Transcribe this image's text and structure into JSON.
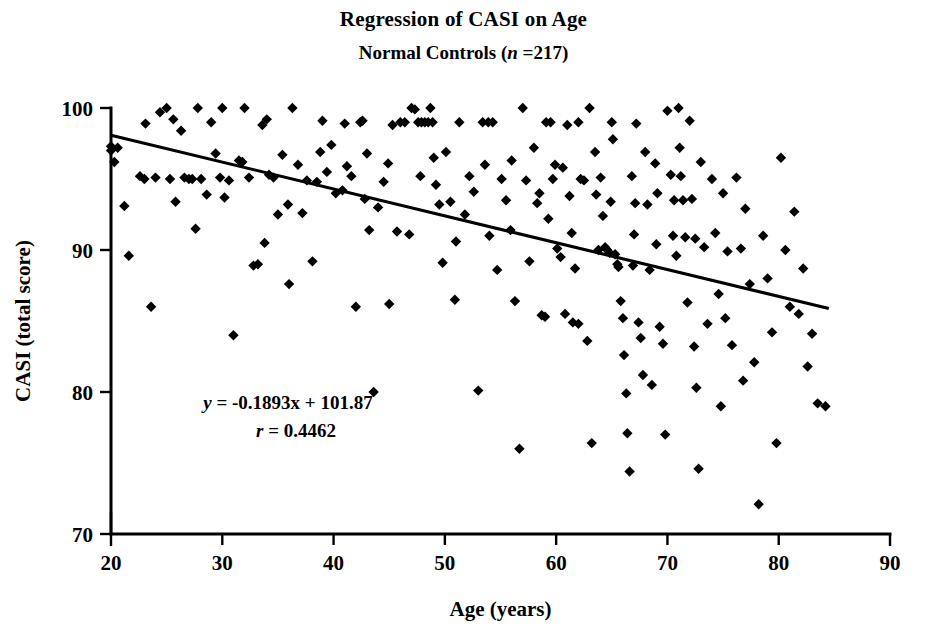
{
  "chart_data": {
    "type": "scatter",
    "title": "Regression of CASI on Age",
    "subtitle_prefix": "Normal Controls (",
    "subtitle_var": "n",
    "subtitle_suffix": " =217)",
    "subtitle_full": "Normal Controls (n =217)",
    "xlabel": "Age (years)",
    "ylabel": "CASI (total score)",
    "xlim": [
      20,
      90
    ],
    "ylim": [
      70,
      100
    ],
    "xticks": [
      20,
      30,
      40,
      50,
      60,
      70,
      80,
      90
    ],
    "yticks": [
      70,
      80,
      90,
      100
    ],
    "grid": false,
    "legend": "none",
    "n": 217,
    "marker": "diamond",
    "marker_color": "#000000",
    "annotations": {
      "equation_y": "y",
      "equation_body": " = -0.1893x  + 101.87",
      "equation_full": "y = -0.1893x  + 101.87",
      "correlation_r": "r",
      "correlation_body": " = 0.4462",
      "correlation_full": "r = 0.4462"
    },
    "fit": {
      "kind": "linear",
      "slope": -0.1893,
      "intercept": 101.87,
      "r": 0.4462,
      "x_start": 20,
      "x_end": 84.5,
      "y_start": 98.08,
      "y_end": 85.88
    },
    "points": [
      [
        20.0,
        97.3
      ],
      [
        20.0,
        97.0
      ],
      [
        20.3,
        96.2
      ],
      [
        20.6,
        97.2
      ],
      [
        21.2,
        93.1
      ],
      [
        21.6,
        89.6
      ],
      [
        22.6,
        95.2
      ],
      [
        23.0,
        95.0
      ],
      [
        23.1,
        98.9
      ],
      [
        23.6,
        86.0
      ],
      [
        24.0,
        95.1
      ],
      [
        24.4,
        99.7
      ],
      [
        25.0,
        100.0
      ],
      [
        25.3,
        95.0
      ],
      [
        25.8,
        93.4
      ],
      [
        26.3,
        98.4
      ],
      [
        26.6,
        95.1
      ],
      [
        27.0,
        95.0
      ],
      [
        27.3,
        95.0
      ],
      [
        27.6,
        91.5
      ],
      [
        28.1,
        95.0
      ],
      [
        28.6,
        93.9
      ],
      [
        29.0,
        99.0
      ],
      [
        29.4,
        96.8
      ],
      [
        29.8,
        95.1
      ],
      [
        30.2,
        93.7
      ],
      [
        30.6,
        94.9
      ],
      [
        31.0,
        84.0
      ],
      [
        31.5,
        96.3
      ],
      [
        32.0,
        100.0
      ],
      [
        32.4,
        95.1
      ],
      [
        32.8,
        88.9
      ],
      [
        33.2,
        89.0
      ],
      [
        33.6,
        98.8
      ],
      [
        34.2,
        95.3
      ],
      [
        34.6,
        95.1
      ],
      [
        35.0,
        92.5
      ],
      [
        35.4,
        96.7
      ],
      [
        35.9,
        93.2
      ],
      [
        36.3,
        100.0
      ],
      [
        36.8,
        96.0
      ],
      [
        37.2,
        92.6
      ],
      [
        37.6,
        94.9
      ],
      [
        38.1,
        89.2
      ],
      [
        38.5,
        94.8
      ],
      [
        39.0,
        99.1
      ],
      [
        39.4,
        95.5
      ],
      [
        39.8,
        97.4
      ],
      [
        40.2,
        94.0
      ],
      [
        40.8,
        94.2
      ],
      [
        41.2,
        95.9
      ],
      [
        41.6,
        95.2
      ],
      [
        42.0,
        86.0
      ],
      [
        42.4,
        99.0
      ],
      [
        42.8,
        93.6
      ],
      [
        43.2,
        91.4
      ],
      [
        43.6,
        80.0
      ],
      [
        44.0,
        93.0
      ],
      [
        44.5,
        94.8
      ],
      [
        44.9,
        96.1
      ],
      [
        45.3,
        98.8
      ],
      [
        45.7,
        91.3
      ],
      [
        46.0,
        99.0
      ],
      [
        46.4,
        99.0
      ],
      [
        46.8,
        91.1
      ],
      [
        47.0,
        100.0
      ],
      [
        47.3,
        99.9
      ],
      [
        47.6,
        99.0
      ],
      [
        47.9,
        99.0
      ],
      [
        48.2,
        99.0
      ],
      [
        48.5,
        99.0
      ],
      [
        48.7,
        100.0
      ],
      [
        48.9,
        99.0
      ],
      [
        49.2,
        94.6
      ],
      [
        49.5,
        93.2
      ],
      [
        49.8,
        89.1
      ],
      [
        50.1,
        96.9
      ],
      [
        50.5,
        93.4
      ],
      [
        50.9,
        86.5
      ],
      [
        51.3,
        99.0
      ],
      [
        51.8,
        92.5
      ],
      [
        52.2,
        95.2
      ],
      [
        52.6,
        94.1
      ],
      [
        53.0,
        80.1
      ],
      [
        53.4,
        99.0
      ],
      [
        53.9,
        99.0
      ],
      [
        54.3,
        99.0
      ],
      [
        54.7,
        88.6
      ],
      [
        55.1,
        95.0
      ],
      [
        55.5,
        93.5
      ],
      [
        55.9,
        91.4
      ],
      [
        56.3,
        86.4
      ],
      [
        56.7,
        76.0
      ],
      [
        57.0,
        100.0
      ],
      [
        57.3,
        94.9
      ],
      [
        57.6,
        89.2
      ],
      [
        58.0,
        97.2
      ],
      [
        58.3,
        93.3
      ],
      [
        58.7,
        85.4
      ],
      [
        59.0,
        85.3
      ],
      [
        59.3,
        92.2
      ],
      [
        59.5,
        99.0
      ],
      [
        59.7,
        95.0
      ],
      [
        59.9,
        96.0
      ],
      [
        60.1,
        90.1
      ],
      [
        60.4,
        89.5
      ],
      [
        60.6,
        95.8
      ],
      [
        60.8,
        85.5
      ],
      [
        61.0,
        98.8
      ],
      [
        61.2,
        93.8
      ],
      [
        61.4,
        91.2
      ],
      [
        61.7,
        88.7
      ],
      [
        62.0,
        99.0
      ],
      [
        62.2,
        95.0
      ],
      [
        62.5,
        94.9
      ],
      [
        62.8,
        83.6
      ],
      [
        63.0,
        100.0
      ],
      [
        63.2,
        76.4
      ],
      [
        63.5,
        96.9
      ],
      [
        63.8,
        90.0
      ],
      [
        64.0,
        95.1
      ],
      [
        64.2,
        92.4
      ],
      [
        64.4,
        90.2
      ],
      [
        64.6,
        90.0
      ],
      [
        64.8,
        89.8
      ],
      [
        65.0,
        99.0
      ],
      [
        65.1,
        97.8
      ],
      [
        65.3,
        89.7
      ],
      [
        65.5,
        89.0
      ],
      [
        65.6,
        88.8
      ],
      [
        65.8,
        86.4
      ],
      [
        66.0,
        85.2
      ],
      [
        66.1,
        82.6
      ],
      [
        66.3,
        79.9
      ],
      [
        66.4,
        77.1
      ],
      [
        66.6,
        74.4
      ],
      [
        66.8,
        95.2
      ],
      [
        67.0,
        91.1
      ],
      [
        67.2,
        98.9
      ],
      [
        67.4,
        84.9
      ],
      [
        67.6,
        83.8
      ],
      [
        67.8,
        81.2
      ],
      [
        68.0,
        96.9
      ],
      [
        68.2,
        93.2
      ],
      [
        68.4,
        88.6
      ],
      [
        68.6,
        80.5
      ],
      [
        68.9,
        96.1
      ],
      [
        69.1,
        94.0
      ],
      [
        69.3,
        84.6
      ],
      [
        69.6,
        83.4
      ],
      [
        69.8,
        77.0
      ],
      [
        70.0,
        99.8
      ],
      [
        70.3,
        95.3
      ],
      [
        70.5,
        91.0
      ],
      [
        70.8,
        89.6
      ],
      [
        71.0,
        100.0
      ],
      [
        71.2,
        95.2
      ],
      [
        71.4,
        93.5
      ],
      [
        71.6,
        90.9
      ],
      [
        71.8,
        86.3
      ],
      [
        72.0,
        99.1
      ],
      [
        72.2,
        93.6
      ],
      [
        72.4,
        83.2
      ],
      [
        72.6,
        80.3
      ],
      [
        72.8,
        74.6
      ],
      [
        73.0,
        96.2
      ],
      [
        73.3,
        90.2
      ],
      [
        73.6,
        84.8
      ],
      [
        74.0,
        95.0
      ],
      [
        74.3,
        91.2
      ],
      [
        74.6,
        86.9
      ],
      [
        75.0,
        94.0
      ],
      [
        75.4,
        89.9
      ],
      [
        75.8,
        83.3
      ],
      [
        76.2,
        95.1
      ],
      [
        76.6,
        90.1
      ],
      [
        77.0,
        92.9
      ],
      [
        77.4,
        87.6
      ],
      [
        77.8,
        82.1
      ],
      [
        78.2,
        72.1
      ],
      [
        78.6,
        91.0
      ],
      [
        79.0,
        88.0
      ],
      [
        79.4,
        84.2
      ],
      [
        79.8,
        76.4
      ],
      [
        80.2,
        96.5
      ],
      [
        80.6,
        90.0
      ],
      [
        81.0,
        86.0
      ],
      [
        81.4,
        92.7
      ],
      [
        81.8,
        85.5
      ],
      [
        82.2,
        88.7
      ],
      [
        82.6,
        81.8
      ],
      [
        83.0,
        84.1
      ],
      [
        83.5,
        79.2
      ],
      [
        84.2,
        79.0
      ],
      [
        25.6,
        99.2
      ],
      [
        27.8,
        100.0
      ],
      [
        31.8,
        96.2
      ],
      [
        33.8,
        90.5
      ],
      [
        36.0,
        87.6
      ],
      [
        38.8,
        96.9
      ],
      [
        41.0,
        98.9
      ],
      [
        43.0,
        96.8
      ],
      [
        45.0,
        86.2
      ],
      [
        49.0,
        96.5
      ],
      [
        51.0,
        90.6
      ],
      [
        54.0,
        91.0
      ],
      [
        56.0,
        96.3
      ],
      [
        58.5,
        94.0
      ],
      [
        61.5,
        84.9
      ],
      [
        62.0,
        84.8
      ],
      [
        63.6,
        93.9
      ],
      [
        64.9,
        93.4
      ],
      [
        66.9,
        88.9
      ],
      [
        69.0,
        90.4
      ],
      [
        70.6,
        93.5
      ],
      [
        72.5,
        90.8
      ],
      [
        74.8,
        79.0
      ],
      [
        76.8,
        80.8
      ],
      [
        30.0,
        100.0
      ],
      [
        34.0,
        99.2
      ],
      [
        42.6,
        99.1
      ],
      [
        47.8,
        95.2
      ],
      [
        53.6,
        96.0
      ],
      [
        59.1,
        99.0
      ],
      [
        67.1,
        93.3
      ],
      [
        71.1,
        97.2
      ],
      [
        75.2,
        85.2
      ]
    ]
  }
}
